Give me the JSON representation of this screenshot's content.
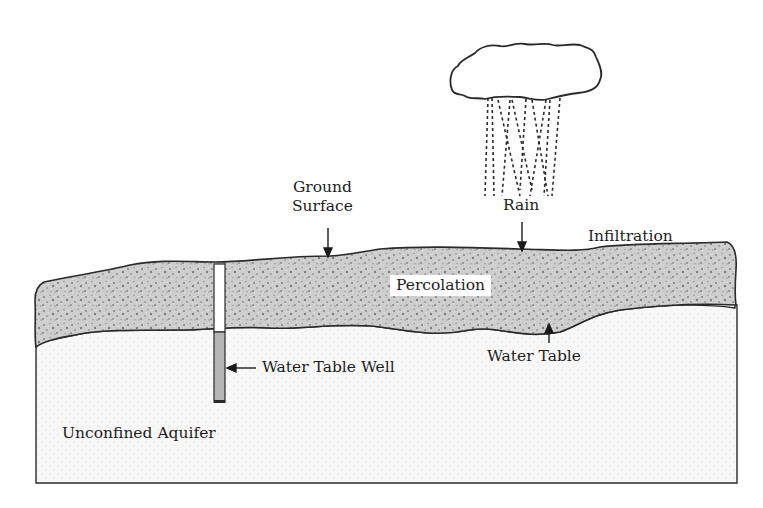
{
  "diagram": {
    "type": "groundwater-cross-section",
    "labels": {
      "ground_surface_line1": "Ground",
      "ground_surface_line2": "Surface",
      "rain": "Rain",
      "infiltration": "Infiltration",
      "percolation": "Percolation",
      "water_table": "Water Table",
      "water_table_well": "Water Table Well",
      "unconfined_aquifer": "Unconfined Aquifer"
    },
    "colors": {
      "outline": "#2a2a2a",
      "unsaturated_zone_fill": "#c9c9c9",
      "unsaturated_zone_speckle": "#8a8a8a",
      "aquifer_fill": "#f7f7f7",
      "aquifer_dots": "#d9d9d9",
      "well_water_fill": "#b3b3b3",
      "well_casing_fill": "#ffffff",
      "background": "#ffffff"
    },
    "elements": [
      "cloud",
      "rain-streaks",
      "unsaturated-zone",
      "unconfined-aquifer",
      "water-table-well"
    ]
  }
}
